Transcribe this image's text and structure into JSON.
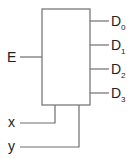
{
  "diagram": {
    "type": "decoder-block",
    "colors": {
      "stroke": "#6e6e6e",
      "text": "#222222",
      "background": "#ffffff"
    },
    "enable_input": {
      "label": "E"
    },
    "select_inputs": [
      {
        "label": "x"
      },
      {
        "label": "y"
      }
    ],
    "outputs": [
      {
        "label": "D",
        "sub": "0"
      },
      {
        "label": "D",
        "sub": "1"
      },
      {
        "label": "D",
        "sub": "2"
      },
      {
        "label": "D",
        "sub": "3"
      }
    ]
  }
}
